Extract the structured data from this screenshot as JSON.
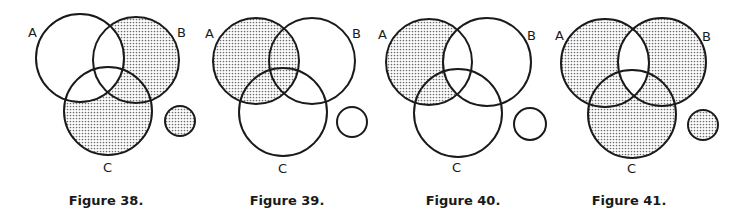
{
  "figures": [
    {
      "caption": "Figure 38.",
      "labels": {
        "a": "A",
        "b": "B",
        "c": "C"
      },
      "shaded_regions": [
        "B only",
        "C only",
        "B∩C not A"
      ],
      "unshaded_regions": [
        "A only",
        "A∩B not C",
        "A∩C not B",
        "A∩B∩C"
      ],
      "small_circle_shaded": true
    },
    {
      "caption": "Figure 39.",
      "labels": {
        "a": "A",
        "b": "B",
        "c": "C"
      },
      "shaded_regions": [
        "A only",
        "A∩B not C",
        "A∩C not B",
        "A∩B∩C"
      ],
      "unshaded_regions": [
        "B only",
        "C only",
        "B∩C not A"
      ],
      "small_circle_shaded": false
    },
    {
      "caption": "Figure 40.",
      "labels": {
        "a": "A",
        "b": "B",
        "c": "C"
      },
      "shaded_regions": [
        "A only",
        "A∩C not B"
      ],
      "unshaded_regions": [
        "B only",
        "C only",
        "A∩B not C",
        "B∩C not A",
        "A∩B∩C"
      ],
      "small_circle_shaded": false
    },
    {
      "caption": "Figure 41.",
      "labels": {
        "a": "A",
        "b": "B",
        "c": "C"
      },
      "shaded_regions": [
        "A only",
        "B only",
        "C only",
        "A∩C not B",
        "B∩C not A"
      ],
      "unshaded_regions": [
        "A∩B not C",
        "A∩B∩C"
      ],
      "small_circle_shaded": true
    }
  ],
  "colors": {
    "stroke": "#1a1a1a",
    "stipple_dot": "#6e6e6e",
    "background": "#ffffff"
  }
}
